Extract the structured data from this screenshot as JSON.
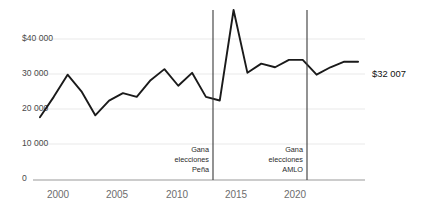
{
  "chart_data": {
    "type": "line",
    "title": "",
    "subtitle": "",
    "xlabel": "",
    "ylabel": "",
    "xlim": [
      1998.5,
      2022.5
    ],
    "ylim": [
      0,
      46000
    ],
    "grid": true,
    "legend_position": "none",
    "x_ticks": [
      "2000",
      "2005",
      "2010",
      "2015",
      "2020"
    ],
    "x_tick_values": [
      2000,
      2005,
      2010,
      2015,
      2020
    ],
    "y_ticks": [
      "$40 000",
      "30 000",
      "20 000",
      "10 000",
      "0"
    ],
    "y_tick_values": [
      40000,
      30000,
      20000,
      10000,
      0
    ],
    "series": [
      {
        "name": "serie",
        "x": [
          1999,
          2000,
          2001,
          2002,
          2003,
          2004,
          2005,
          2006,
          2007,
          2008,
          2009,
          2010,
          2011,
          2012,
          2013,
          2014,
          2015,
          2016,
          2017,
          2018,
          2019,
          2020,
          2021,
          2022
        ],
        "values": [
          17000,
          22500,
          28500,
          24000,
          17500,
          21500,
          23500,
          22500,
          27000,
          30000,
          25500,
          29000,
          22500,
          21500,
          46000,
          29000,
          31500,
          30500,
          32500,
          32500,
          28500,
          30500,
          32007,
          32007
        ]
      }
    ],
    "end_label": "$32 007",
    "annotations": [
      {
        "name": "gana-elecciones-pena",
        "x_value": 2012,
        "lines": [
          "Gana",
          "elecciones",
          "Peña"
        ]
      },
      {
        "name": "gana-elecciones-amlo",
        "x_value": 2018,
        "lines": [
          "Gana",
          "elecciones",
          "AMLO"
        ]
      }
    ]
  }
}
